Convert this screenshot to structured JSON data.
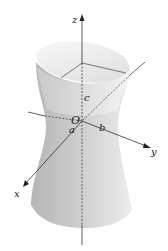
{
  "figure": {
    "axes": {
      "x_label": "x",
      "y_label": "y",
      "z_label": "z"
    },
    "origin_label": "O",
    "semi_axis_labels": {
      "a": "a",
      "b": "b",
      "c": "c"
    },
    "colors": {
      "surface_light": "#f2f2f2",
      "surface_dark": "#b8b8b8",
      "axis": "#333333",
      "background": "#ffffff"
    }
  }
}
